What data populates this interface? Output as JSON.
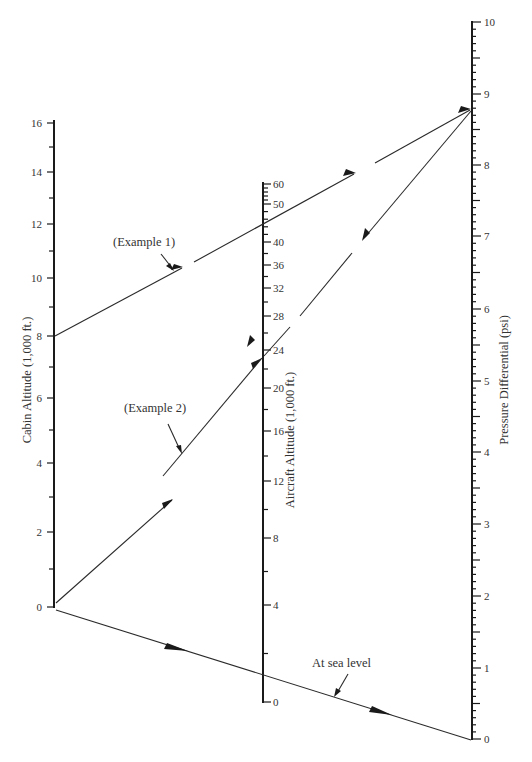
{
  "diagram": {
    "type": "nomogram",
    "axes": {
      "cabin": {
        "title": "Cabin Altitude (1,000 ft.)",
        "ticks": [
          {
            "v": "0",
            "y": 607
          },
          {
            "v": "2",
            "y": 532
          },
          {
            "v": "4",
            "y": 463
          },
          {
            "v": "6",
            "y": 398
          },
          {
            "v": "8",
            "y": 336
          },
          {
            "v": "10",
            "y": 278
          },
          {
            "v": "12",
            "y": 224
          },
          {
            "v": "14",
            "y": 172
          },
          {
            "v": "16",
            "y": 123
          }
        ],
        "minor_y": [
          569,
          497,
          430,
          367,
          307,
          251,
          198,
          147
        ]
      },
      "aircraft": {
        "title": "Aircraft Altitude (1,000 ft.)",
        "ticks": [
          {
            "v": "0",
            "y": 702
          },
          {
            "v": "4",
            "y": 605
          },
          {
            "v": "8",
            "y": 538
          },
          {
            "v": "12",
            "y": 481
          },
          {
            "v": "16",
            "y": 431
          },
          {
            "v": "20",
            "y": 388
          },
          {
            "v": "24",
            "y": 350
          },
          {
            "v": "28",
            "y": 316
          },
          {
            "v": "32",
            "y": 288
          },
          {
            "v": "36",
            "y": 265
          },
          {
            "v": "40",
            "y": 242
          },
          {
            "v": "50",
            "y": 204
          },
          {
            "v": "60",
            "y": 184
          }
        ]
      },
      "pressure": {
        "title": "Pressure Differential (psi)",
        "ticks": [
          {
            "v": "0",
            "y": 739
          },
          {
            "v": "1",
            "y": 668
          },
          {
            "v": "2",
            "y": 596
          },
          {
            "v": "3",
            "y": 524
          },
          {
            "v": "4",
            "y": 452
          },
          {
            "v": "5",
            "y": 381
          },
          {
            "v": "6",
            "y": 309
          },
          {
            "v": "7",
            "y": 236
          },
          {
            "v": "8",
            "y": 165
          },
          {
            "v": "9",
            "y": 94
          },
          {
            "v": "10",
            "y": 22
          }
        ]
      }
    },
    "annotations": {
      "example1": "(Example 1)",
      "example2": "(Example 2)",
      "sea_level": "At sea level"
    },
    "examples": [
      {
        "name": "Example 1",
        "cabin_altitude": "8",
        "aircraft_altitude": "~45",
        "pressure_differential": "~8.8"
      },
      {
        "name": "Example 2",
        "cabin_altitude": "0",
        "aircraft_altitude": "~23",
        "pressure_differential": "~8.8"
      },
      {
        "name": "At sea level",
        "cabin_altitude": "0",
        "aircraft_altitude": "0",
        "pressure_differential": "0"
      }
    ]
  }
}
